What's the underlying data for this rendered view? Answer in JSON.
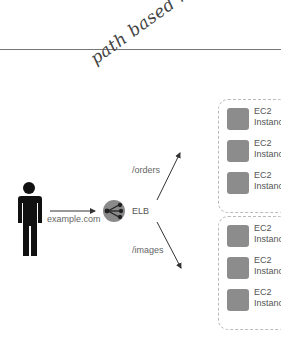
{
  "annotation": {
    "text": "path based routing"
  },
  "client": {
    "icon": "person-icon",
    "label": "example.com"
  },
  "load_balancer": {
    "icon": "elb-icon",
    "label": "ELB",
    "color": "#8a8a8a"
  },
  "routes": [
    {
      "path": "/orders"
    },
    {
      "path": "/images"
    }
  ],
  "groups": [
    {
      "instances": [
        {
          "line1": "EC2",
          "line2": "Instance"
        },
        {
          "line1": "EC2",
          "line2": "Instance"
        },
        {
          "line1": "EC2",
          "line2": "Instance"
        }
      ]
    },
    {
      "instances": [
        {
          "line1": "EC2",
          "line2": "Instance"
        },
        {
          "line1": "EC2",
          "line2": "Instance"
        },
        {
          "line1": "EC2",
          "line2": "Instance"
        }
      ]
    }
  ]
}
